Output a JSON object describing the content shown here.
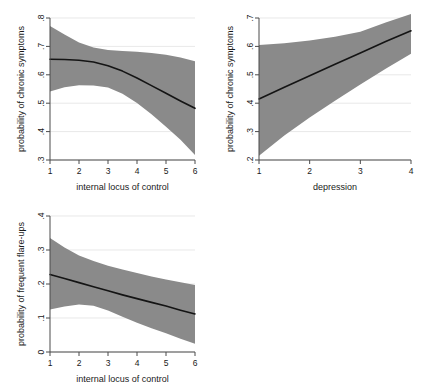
{
  "figure": {
    "background": "#ffffff",
    "band_color": "#8a8a8a",
    "line_color": "#141414",
    "axis_color": "#4a4a4a"
  },
  "chart_data": [
    {
      "id": "panel-locus-chronic",
      "type": "line",
      "title": "",
      "xlabel": "internal locus of control",
      "ylabel": "probability of chronic symptoms",
      "xlim": [
        1,
        6
      ],
      "ylim": [
        0.3,
        0.8
      ],
      "xticks": [
        1,
        2,
        3,
        4,
        5,
        6
      ],
      "xticklabels": [
        "1",
        "2",
        "3",
        "4",
        "5",
        "6"
      ],
      "yticks": [
        0.3,
        0.4,
        0.5,
        0.6,
        0.7,
        0.8
      ],
      "yticklabels": [
        ".3",
        ".4",
        ".5",
        ".6",
        ".7",
        ".8"
      ],
      "grid": false,
      "legend": "none",
      "x": [
        1,
        1.5,
        2,
        2.5,
        3,
        3.5,
        4,
        4.5,
        5,
        5.5,
        6
      ],
      "series": [
        {
          "name": "predicted probability",
          "role": "fit",
          "values": [
            0.655,
            0.654,
            0.651,
            0.645,
            0.632,
            0.613,
            0.589,
            0.562,
            0.535,
            0.508,
            0.482
          ]
        },
        {
          "name": "95% confidence interval upper",
          "role": "ci_upper",
          "values": [
            0.772,
            0.742,
            0.714,
            0.696,
            0.687,
            0.684,
            0.681,
            0.677,
            0.671,
            0.661,
            0.648
          ]
        },
        {
          "name": "95% confidence interval lower",
          "role": "ci_lower",
          "values": [
            0.541,
            0.556,
            0.563,
            0.562,
            0.555,
            0.533,
            0.501,
            0.461,
            0.417,
            0.371,
            0.318
          ]
        }
      ]
    },
    {
      "id": "panel-depression-chronic",
      "type": "line",
      "title": "",
      "xlabel": "depression",
      "ylabel": "probability of chronic symptoms",
      "xlim": [
        1,
        4
      ],
      "ylim": [
        0.2,
        0.7
      ],
      "xticks": [
        1,
        2,
        3,
        4
      ],
      "xticklabels": [
        "1",
        "2",
        "3",
        "4"
      ],
      "yticks": [
        0.2,
        0.3,
        0.4,
        0.5,
        0.6,
        0.7
      ],
      "yticklabels": [
        ".2",
        ".3",
        ".4",
        ".5",
        ".6",
        ".7"
      ],
      "grid": false,
      "legend": "none",
      "x": [
        1,
        1.5,
        2,
        2.5,
        3,
        3.5,
        4
      ],
      "series": [
        {
          "name": "predicted probability",
          "role": "fit",
          "values": [
            0.415,
            0.456,
            0.497,
            0.537,
            0.577,
            0.617,
            0.655
          ]
        },
        {
          "name": "95% confidence interval upper",
          "role": "ci_upper",
          "values": [
            0.605,
            0.611,
            0.621,
            0.634,
            0.652,
            0.684,
            0.714
          ]
        },
        {
          "name": "95% confidence interval lower",
          "role": "ci_lower",
          "values": [
            0.215,
            0.286,
            0.35,
            0.409,
            0.466,
            0.521,
            0.574
          ]
        }
      ]
    },
    {
      "id": "panel-locus-flareups",
      "type": "line",
      "title": "",
      "xlabel": "internal locus of control",
      "ylabel": "probability of frequent flare-ups",
      "xlim": [
        1,
        6
      ],
      "ylim": [
        0.0,
        0.4
      ],
      "xticks": [
        1,
        2,
        3,
        4,
        5,
        6
      ],
      "xticklabels": [
        "1",
        "2",
        "3",
        "4",
        "5",
        "6"
      ],
      "yticks": [
        0.0,
        0.1,
        0.2,
        0.3,
        0.4
      ],
      "yticklabels": [
        "0",
        ".1",
        ".2",
        ".3",
        ".4"
      ],
      "grid": false,
      "legend": "none",
      "x": [
        1,
        1.5,
        2,
        2.5,
        3,
        3.5,
        4,
        4.5,
        5,
        5.5,
        6
      ],
      "series": [
        {
          "name": "predicted probability",
          "role": "fit",
          "values": [
            0.228,
            0.216,
            0.204,
            0.192,
            0.18,
            0.168,
            0.157,
            0.146,
            0.135,
            0.123,
            0.112
          ]
        },
        {
          "name": "95% confidence interval upper",
          "role": "ci_upper",
          "values": [
            0.335,
            0.307,
            0.284,
            0.268,
            0.254,
            0.243,
            0.232,
            0.222,
            0.213,
            0.205,
            0.197
          ]
        },
        {
          "name": "95% confidence interval lower",
          "role": "ci_lower",
          "values": [
            0.125,
            0.134,
            0.14,
            0.136,
            0.122,
            0.104,
            0.086,
            0.07,
            0.055,
            0.039,
            0.024
          ]
        }
      ]
    }
  ]
}
